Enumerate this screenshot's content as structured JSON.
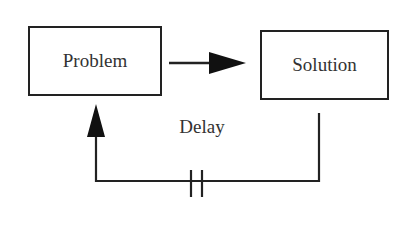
{
  "diagram": {
    "nodes": [
      {
        "id": "problem",
        "label": "Problem"
      },
      {
        "id": "solution",
        "label": "Solution"
      }
    ],
    "edges": [
      {
        "from": "problem",
        "to": "solution",
        "label": ""
      },
      {
        "from": "solution",
        "to": "problem",
        "label": "Delay",
        "marker": "double-bar delay mark"
      }
    ],
    "delay_label": "Delay"
  }
}
